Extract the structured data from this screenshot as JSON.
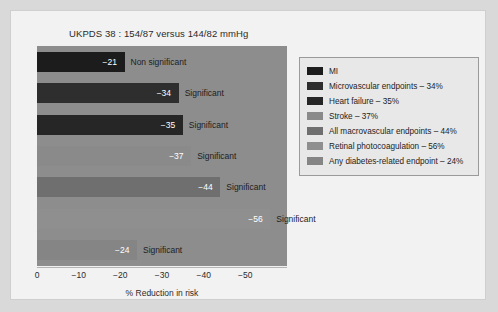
{
  "chart_data": {
    "type": "bar",
    "title": "UKPDS 38 : 154/87 versus 144/82 mmHg",
    "xlabel": "% Reduction in risk",
    "ylabel": "",
    "orientation": "horizontal",
    "xlim": [
      0,
      -55
    ],
    "xticks": [
      "0",
      "−10",
      "−20",
      "−30",
      "−40",
      "−50"
    ],
    "xtick_values": [
      0,
      -10,
      -20,
      -30,
      -40,
      -50
    ],
    "grid": false,
    "legend_position": "right",
    "categories": [
      "MI",
      "Microvascular endpoints",
      "Heart failure",
      "Stroke",
      "All macrovascular endpoints",
      "Retinal photocoagulation",
      "Any diabetes-related endpoint"
    ],
    "values": [
      -21,
      -34,
      -35,
      -37,
      -44,
      -56,
      -24
    ],
    "value_labels": [
      "−21",
      "−34",
      "−35",
      "−37",
      "−44",
      "−56",
      "−24"
    ],
    "significance": [
      "Non significant",
      "Significant",
      "Significant",
      "Significant",
      "Significant",
      "Significant",
      "Significant"
    ],
    "colors": [
      "#1c1c1c",
      "#2e2e2e",
      "#262626",
      "#8a8a8a",
      "#6f6f6f",
      "#8f8f8f",
      "#858585"
    ],
    "plot_background": "#8d8d8d"
  },
  "legend": {
    "items": [
      {
        "label": "MI",
        "color": "#1c1c1c"
      },
      {
        "label": "Microvascular endpoints – 34%",
        "color": "#2e2e2e"
      },
      {
        "label": "Heart failure – 35%",
        "color": "#262626"
      },
      {
        "label": "Stroke – 37%",
        "color": "#8a8a8a"
      },
      {
        "label": "All macrovascular endpoints – 44%",
        "color": "#6f6f6f"
      },
      {
        "label": "Retinal photocoagulation – 56%",
        "color": "#8f8f8f"
      },
      {
        "label": "Any diabetes-related endpoint – 24%",
        "color": "#858585"
      }
    ]
  }
}
